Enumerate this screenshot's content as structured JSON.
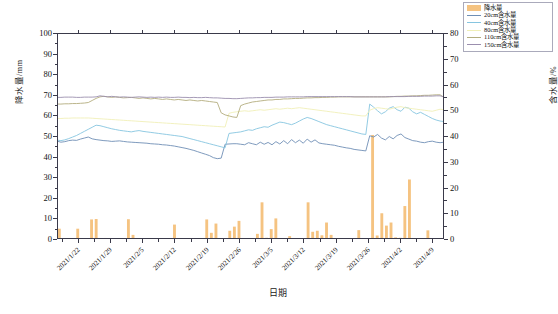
{
  "chart_data": {
    "type": "bar",
    "title": "",
    "xlabel": "日期",
    "ylabel": "降水量/mm",
    "ylabel_right": "含水量/%",
    "ylim": [
      0,
      100
    ],
    "ylim_right": [
      0,
      80
    ],
    "yticks": [
      0,
      10,
      20,
      30,
      40,
      50,
      60,
      70,
      80,
      90,
      100
    ],
    "yticks_right": [
      0,
      10,
      20,
      30,
      40,
      50,
      60,
      70,
      80
    ],
    "grid": false,
    "legend_position": "top-right",
    "categories": [
      "2021/1/22",
      "2021/1/29",
      "2021/2/5",
      "2021/2/12",
      "2021/2/19",
      "2021/2/26",
      "2021/3/5",
      "2021/3/12",
      "2021/3/19",
      "2021/3/26",
      "2021/4/2",
      "2021/4/9"
    ],
    "x_start": "2021/1/18",
    "x_end": "2021/4/15",
    "bar_series": {
      "name": "降水量",
      "color": "#f5c381",
      "unit": "mm",
      "axis": "left",
      "values": [
        5.0,
        0,
        0,
        0,
        5.0,
        0,
        0,
        9.5,
        9.7,
        0,
        0.5,
        0,
        0,
        0,
        0.4,
        9.6,
        2.0,
        0,
        0,
        0,
        0,
        0,
        0,
        0,
        0,
        7.0,
        0,
        0,
        0,
        0,
        0,
        0,
        9.5,
        3.0,
        7.5,
        0.4,
        0,
        4.0,
        6.0,
        8.8,
        0.3,
        0,
        0,
        2.5,
        17.8,
        0.6,
        4.8,
        10.0,
        0,
        0,
        1.4,
        0.3,
        0,
        0,
        17.8,
        3.5,
        4.0,
        1.8,
        8.0,
        2.0,
        0,
        0,
        0,
        0,
        0,
        4.3,
        0,
        0,
        50.5,
        1.7,
        12.5,
        6.5,
        8.0,
        0.8,
        0.6,
        16.0,
        28.9,
        0.4,
        0,
        0,
        4.2,
        0,
        0,
        0.5
      ]
    },
    "line_series": [
      {
        "name": "20cm含水量",
        "color": "#6f8fb5",
        "axis": "right",
        "unit": "%",
        "values": [
          38.0,
          37.6,
          37.8,
          38.2,
          38.4,
          38.3,
          38.8,
          39.2,
          39.6,
          38.9,
          38.6,
          38.4,
          38.2,
          38.1,
          37.9,
          38.0,
          38.1,
          37.9,
          37.7,
          37.6,
          37.5,
          37.4,
          37.3,
          37.2,
          37.0,
          36.9,
          36.8,
          36.6,
          36.5,
          36.3,
          36.1,
          35.8,
          35.5,
          35.2,
          34.8,
          34.4,
          33.9,
          33.4,
          32.9,
          32.4,
          31.6,
          31.2,
          31.4,
          36.8,
          36.9,
          37.0,
          37.0,
          36.8,
          36.6,
          37.4,
          37.0,
          36.6,
          37.6,
          36.8,
          37.5,
          36.6,
          37.8,
          36.9,
          38.2,
          37.0,
          38.6,
          37.4,
          38.4,
          37.2,
          38.8,
          37.6,
          38.5,
          37.3,
          37.0,
          36.8,
          36.6,
          36.4,
          36.0,
          35.7,
          35.4,
          35.2,
          34.8,
          34.6,
          34.4,
          34.2,
          40.1,
          39.6,
          40.6,
          39.2,
          38.5,
          39.8,
          38.9,
          40.2,
          40.8,
          39.4,
          38.8,
          38.2,
          38.0,
          37.6,
          37.4,
          37.8,
          38.0,
          37.6,
          37.4,
          37.6
        ]
      },
      {
        "name": "40cm含水量",
        "color": "#86c5e0",
        "axis": "right",
        "unit": "%",
        "values": [
          38.4,
          38.2,
          38.5,
          39.0,
          39.6,
          40.2,
          41.0,
          41.8,
          42.6,
          43.4,
          44.2,
          44.0,
          43.6,
          43.2,
          42.8,
          42.5,
          42.2,
          42.0,
          41.8,
          41.6,
          41.9,
          42.1,
          41.8,
          41.6,
          41.4,
          41.2,
          41.0,
          40.8,
          40.6,
          40.4,
          40.2,
          40.0,
          39.8,
          39.4,
          39.0,
          38.6,
          38.2,
          37.8,
          37.4,
          37.0,
          36.6,
          36.2,
          35.8,
          35.4,
          41.0,
          41.2,
          41.4,
          41.6,
          42.0,
          42.4,
          42.2,
          42.8,
          43.2,
          43.6,
          43.4,
          44.2,
          44.8,
          45.4,
          45.2,
          44.8,
          44.4,
          45.0,
          45.8,
          46.6,
          47.2,
          46.8,
          46.2,
          45.6,
          45.0,
          44.4,
          44.0,
          43.6,
          43.2,
          42.8,
          42.4,
          42.0,
          41.6,
          41.2,
          40.8,
          40.6,
          52.4,
          51.2,
          49.8,
          48.6,
          49.4,
          50.8,
          51.4,
          50.2,
          49.6,
          51.2,
          50.8,
          49.4,
          48.6,
          49.2,
          48.4,
          47.6,
          46.8,
          46.2,
          45.8,
          45.6
        ]
      },
      {
        "name": "80cm含水量",
        "color": "#f0efb8",
        "axis": "right",
        "unit": "%",
        "values": [
          46.8,
          46.8,
          46.9,
          46.9,
          47.0,
          47.0,
          47.0,
          47.0,
          47.0,
          46.9,
          46.8,
          46.7,
          46.6,
          46.5,
          46.4,
          46.3,
          46.2,
          46.1,
          46.0,
          45.9,
          45.8,
          45.7,
          45.6,
          45.5,
          45.4,
          45.3,
          45.2,
          45.1,
          45.0,
          44.9,
          44.8,
          44.7,
          44.6,
          44.5,
          44.4,
          44.3,
          44.2,
          44.1,
          44.0,
          43.9,
          43.8,
          43.7,
          43.6,
          43.5,
          48.8,
          49.2,
          49.4,
          49.6,
          49.8,
          49.6,
          49.8,
          50.0,
          50.2,
          50.0,
          50.2,
          50.4,
          50.6,
          50.4,
          50.6,
          50.8,
          50.6,
          50.8,
          51.0,
          50.8,
          50.6,
          50.4,
          50.2,
          50.0,
          49.8,
          49.6,
          49.4,
          49.2,
          49.0,
          48.8,
          48.6,
          48.4,
          48.2,
          48.0,
          47.8,
          47.8,
          50.0,
          50.6,
          51.0,
          50.8,
          50.6,
          50.4,
          50.8,
          51.2,
          51.4,
          51.0,
          50.8,
          50.6,
          50.4,
          50.2,
          50.0,
          49.8,
          49.6,
          50.0,
          50.4,
          50.2
        ]
      },
      {
        "name": "110cm含水量",
        "color": "#b3ad7e",
        "axis": "right",
        "unit": "%",
        "values": [
          52.4,
          52.4,
          52.5,
          52.5,
          52.6,
          52.6,
          52.7,
          52.8,
          53.0,
          53.8,
          54.6,
          55.2,
          55.4,
          55.2,
          55.0,
          55.2,
          55.0,
          54.8,
          54.9,
          55.0,
          54.8,
          54.6,
          54.8,
          54.6,
          54.4,
          54.6,
          54.4,
          54.2,
          54.4,
          54.2,
          54.0,
          54.2,
          54.0,
          53.8,
          54.0,
          53.8,
          53.6,
          53.8,
          53.6,
          53.4,
          53.2,
          53.0,
          49.0,
          48.2,
          47.8,
          47.4,
          47.2,
          51.8,
          52.4,
          52.8,
          53.2,
          53.4,
          53.6,
          53.8,
          54.0,
          54.0,
          54.2,
          54.2,
          54.4,
          54.4,
          54.5,
          54.6,
          54.6,
          54.7,
          54.8,
          54.8,
          54.9,
          54.9,
          55.0,
          55.0,
          55.1,
          55.1,
          55.2,
          55.2,
          55.2,
          55.2,
          55.2,
          55.2,
          55.2,
          55.2,
          55.2,
          55.2,
          55.2,
          55.2,
          55.2,
          55.2,
          55.3,
          55.4,
          55.4,
          55.5,
          55.5,
          55.6,
          55.6,
          55.7,
          55.8,
          55.8,
          55.9,
          56.0,
          56.0,
          55.0
        ]
      },
      {
        "name": "150cm含水量",
        "color": "#9b8fae",
        "axis": "right",
        "unit": "%",
        "values": [
          55.0,
          55.0,
          55.1,
          55.1,
          55.1,
          55.0,
          55.0,
          55.1,
          55.1,
          55.1,
          55.2,
          55.6,
          55.4,
          55.2,
          55.4,
          55.2,
          55.1,
          55.2,
          55.1,
          55.0,
          55.1,
          55.2,
          55.1,
          55.0,
          55.1,
          55.0,
          55.1,
          55.0,
          55.1,
          55.0,
          55.0,
          55.1,
          55.0,
          55.0,
          54.9,
          55.0,
          54.9,
          54.9,
          55.0,
          54.9,
          54.8,
          54.8,
          54.7,
          54.6,
          54.6,
          54.5,
          54.5,
          54.6,
          54.7,
          54.8,
          54.8,
          54.9,
          54.9,
          55.0,
          55.0,
          55.0,
          55.1,
          55.1,
          55.1,
          55.2,
          55.2,
          55.2,
          55.2,
          55.2,
          55.3,
          55.3,
          55.3,
          55.3,
          55.3,
          55.3,
          55.3,
          55.3,
          55.3,
          55.3,
          55.3,
          55.3,
          55.2,
          55.2,
          55.2,
          55.2,
          55.2,
          55.2,
          55.2,
          55.2,
          55.2,
          55.3,
          55.3,
          55.3,
          55.3,
          55.3,
          55.4,
          55.4,
          55.4,
          55.4,
          55.5,
          55.5,
          55.5,
          55.6,
          55.6,
          55.2
        ]
      }
    ]
  },
  "legend": {
    "items": [
      {
        "label": "降水量",
        "type": "bar",
        "color": "#f5c381"
      },
      {
        "label": "20cm含水量",
        "type": "line",
        "color": "#6f8fb5"
      },
      {
        "label": "40cm含水量",
        "type": "line",
        "color": "#86c5e0"
      },
      {
        "label": "80cm含水量",
        "type": "line",
        "color": "#f0efb8"
      },
      {
        "label": "110cm含水量",
        "type": "line",
        "color": "#b3ad7e"
      },
      {
        "label": "150cm含水量",
        "type": "line",
        "color": "#9b8fae"
      }
    ]
  }
}
